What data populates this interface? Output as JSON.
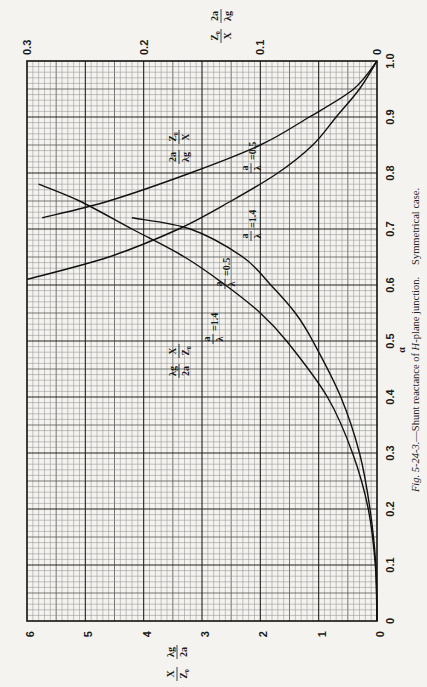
{
  "chart_data": {
    "type": "line",
    "caption": {
      "fig": "Fig. 5-24-3.",
      "text": "—Shunt reactance of ",
      "italic": "H",
      "text2": "-plane junction.",
      "text3": "Symmetrical case."
    },
    "orientation": "rotated-90",
    "xlabel": "α",
    "x_axis": {
      "range": [
        0,
        1.0
      ],
      "ticks": [
        "0",
        "0.1",
        "0.2",
        "0.3",
        "0.4",
        "0.5",
        "0.6",
        "0.7",
        "0.8",
        "0.9",
        "1.0"
      ]
    },
    "ylabel_left": "X/Z₀ · λg/2a",
    "y_axis_left": {
      "range": [
        0,
        6
      ],
      "ticks": [
        "0",
        "1",
        "2",
        "3",
        "4",
        "5",
        "6"
      ]
    },
    "ylabel_right": "Z₀/X · 2a/λg",
    "y_axis_right": {
      "range": [
        0,
        0.3
      ],
      "ticks": [
        "0",
        "0.1",
        "0.2",
        "0.3"
      ]
    },
    "grid": {
      "major_x": 0.1,
      "major_y": 1,
      "minor_divisions": 10
    },
    "series": [
      {
        "name": "λg/2a · X/Z₀, a/λ = 0.5",
        "axis": "left",
        "alpha": [
          0.0,
          0.1,
          0.2,
          0.3,
          0.4,
          0.5,
          0.55,
          0.6,
          0.65,
          0.7,
          0.72
        ],
        "values": [
          0.0,
          0.02,
          0.12,
          0.3,
          0.62,
          1.1,
          1.4,
          1.82,
          2.3,
          3.2,
          4.2
        ]
      },
      {
        "name": "λg/2a · X/Z₀, a/λ = 1.4",
        "axis": "left",
        "alpha": [
          0.0,
          0.1,
          0.2,
          0.3,
          0.4,
          0.5,
          0.55,
          0.6,
          0.65,
          0.7,
          0.75,
          0.78
        ],
        "values": [
          0.0,
          0.03,
          0.15,
          0.42,
          0.85,
          1.55,
          2.0,
          2.6,
          3.3,
          4.2,
          5.1,
          5.8
        ]
      },
      {
        "name": "2a/λg · Z₀/X, a/λ = 0.5",
        "axis": "right",
        "alpha": [
          0.72,
          0.75,
          0.8,
          0.85,
          0.9,
          0.95,
          1.0
        ],
        "values": [
          0.287,
          0.23,
          0.16,
          0.1,
          0.058,
          0.02,
          0.0
        ]
      },
      {
        "name": "2a/λg · Z₀/X, a/λ = 1.4",
        "axis": "right",
        "alpha": [
          0.61,
          0.65,
          0.7,
          0.75,
          0.8,
          0.85,
          0.9,
          0.95,
          1.0
        ],
        "values": [
          0.3,
          0.23,
          0.17,
          0.125,
          0.085,
          0.055,
          0.035,
          0.015,
          0.0
        ]
      }
    ],
    "annotations": [
      "λg/2a · X/Z₀",
      "2a/λg · Z₀/X",
      "a/λ = 0.5",
      "a/λ = 1.4"
    ]
  },
  "labels": {
    "left_axis_a": "X",
    "left_axis_b": "Z₀",
    "left_axis_c": "λg",
    "left_axis_d": "2a",
    "right_axis_a": "Z₀",
    "right_axis_b": "X",
    "right_axis_c": "2a",
    "right_axis_d": "λg",
    "alpha": "α",
    "react_num1": "λg",
    "react_den1": "2a",
    "react_num2": "X",
    "react_den2": "Z₀",
    "susc_num1": "2a",
    "susc_den1": "λg",
    "susc_num2": "Z₀",
    "susc_den2": "X",
    "a_over_lambda_num": "a",
    "a_over_lambda_den": "λ",
    "eq_05": "=0.5",
    "eq_14": "=1.4"
  }
}
